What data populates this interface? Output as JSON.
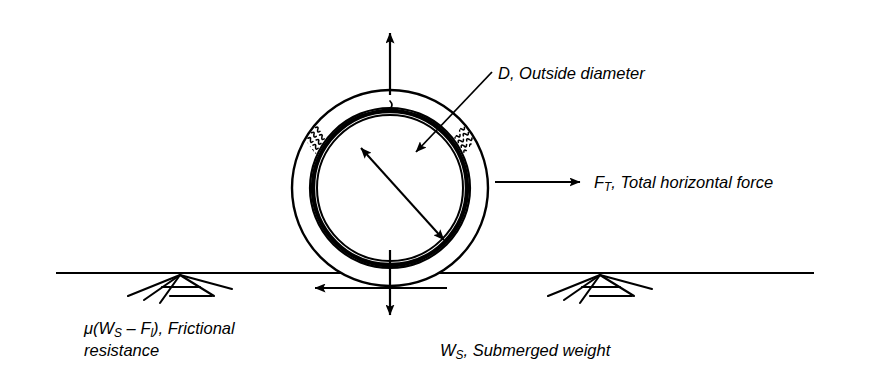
{
  "figure": {
    "type": "engineering-diagram",
    "background_color": "#ffffff",
    "line_color": "#000000",
    "width": 869,
    "height": 389
  },
  "labels": {
    "outside_diameter": {
      "symbol": "D",
      "separator": ", ",
      "text": "Outside diameter",
      "full": "D, Outside diameter"
    },
    "total_horizontal_force": {
      "symbol": "F",
      "subscript": "T",
      "separator": ", ",
      "text": "Total horizontal force",
      "full": "FT, Total horizontal force"
    },
    "frictional_resistance": {
      "expression_prefix": "μ(W",
      "subscript_1": "S",
      "expression_middle": " – F",
      "subscript_2": "l",
      "expression_suffix": "), Frictional",
      "line2": "resistance",
      "full": "μ(WS – Fl), Frictional resistance"
    },
    "submerged_weight": {
      "symbol": "W",
      "subscript": "S",
      "separator": ", ",
      "text": "Submerged weight",
      "full": "WS, Submerged weight"
    }
  },
  "pipe": {
    "center_x": 390,
    "center_y": 188,
    "coating_outer_radius": 98,
    "coating_inner_radius": 80,
    "steel_outer_radius": 80,
    "steel_inner_radius": 74,
    "bore_radius": 72,
    "coating_name": "concrete weight coating",
    "coating_texture": "aggregate squiggles"
  },
  "arrows": {
    "buoyancy_up": {
      "x": 390,
      "y_from": 95,
      "y_to": 32,
      "direction": "up"
    },
    "horizontal_force_right": {
      "y": 182,
      "x_from": 495,
      "x_to": 581,
      "direction": "right"
    },
    "submerged_weight_down": {
      "x": 390,
      "y_from": 255,
      "y_to": 316,
      "direction": "down"
    },
    "friction_left": {
      "y": 288,
      "x_from": 447,
      "x_to": 314,
      "direction": "left"
    },
    "diameter_double": {
      "x1": 361,
      "y1": 148,
      "x2": 444,
      "y2": 240,
      "direction": "both"
    },
    "leader_outside_diameter": {
      "x1": 492,
      "y1": 72,
      "x2": 414,
      "y2": 154,
      "direction": "to-pipe"
    }
  },
  "ground": {
    "line_y": 273,
    "x_from": 56,
    "x_to": 814,
    "supports": [
      {
        "name": "support-left",
        "x": 152
      },
      {
        "name": "support-right",
        "x": 572
      }
    ]
  }
}
